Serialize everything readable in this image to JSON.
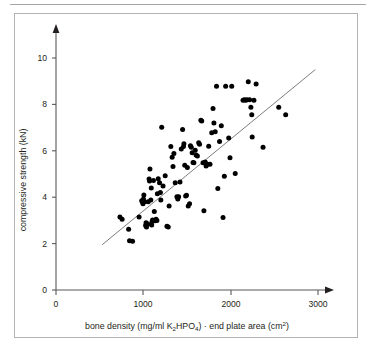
{
  "figure": {
    "background_color": "#ffffff",
    "frame_color": "#b3b3b3",
    "axis_color": "#58595b",
    "point_color": "#000000",
    "trend_color": "#6d6e71"
  },
  "chart_data": {
    "type": "scatter",
    "title": "",
    "xlabel_parts": {
      "p1": "bone density (mg/ml K",
      "sub1": "2",
      "p2": "HPO",
      "sub2": "4",
      "p3": ") · end plate area (cm",
      "sup1": "2",
      "p4": ")"
    },
    "xlabel": "bone density (mg/ml K2HPO4) · end plate area (cm2)",
    "ylabel": "compressive strength (kN)",
    "xticks": [
      0,
      1000,
      2000,
      3000
    ],
    "xtick_labels": [
      "0",
      "1000",
      "2000",
      "3000"
    ],
    "yticks": [
      0,
      2,
      4,
      6,
      8,
      10
    ],
    "ytick_labels": [
      "0",
      "2",
      "4",
      "6",
      "8",
      "10"
    ],
    "xlim": [
      0,
      3120
    ],
    "ylim": [
      0,
      11.2
    ],
    "grid": false,
    "legend": null,
    "trend_line": {
      "x": [
        530,
        2980
      ],
      "y": [
        1.95,
        9.5
      ]
    },
    "points": [
      [
        735,
        3.15
      ],
      [
        760,
        3.05
      ],
      [
        835,
        2.62
      ],
      [
        845,
        2.12
      ],
      [
        880,
        2.1
      ],
      [
        955,
        3.15
      ],
      [
        985,
        3.85
      ],
      [
        995,
        3.78
      ],
      [
        1000,
        3.72
      ],
      [
        1005,
        3.92
      ],
      [
        1010,
        4.1
      ],
      [
        1020,
        3.8
      ],
      [
        1030,
        2.78
      ],
      [
        1035,
        2.9
      ],
      [
        1040,
        2.72
      ],
      [
        1055,
        2.85
      ],
      [
        1060,
        3.8
      ],
      [
        1070,
        4.78
      ],
      [
        1075,
        4.7
      ],
      [
        1080,
        5.22
      ],
      [
        1090,
        3.88
      ],
      [
        1095,
        4.4
      ],
      [
        1100,
        2.8
      ],
      [
        1105,
        2.95
      ],
      [
        1110,
        3.02
      ],
      [
        1120,
        4.72
      ],
      [
        1130,
        3.38
      ],
      [
        1140,
        2.98
      ],
      [
        1150,
        3.05
      ],
      [
        1160,
        3.0
      ],
      [
        1165,
        4.15
      ],
      [
        1175,
        4.8
      ],
      [
        1190,
        4.62
      ],
      [
        1200,
        4.2
      ],
      [
        1205,
        3.88
      ],
      [
        1215,
        7.02
      ],
      [
        1230,
        4.48
      ],
      [
        1255,
        4.92
      ],
      [
        1275,
        2.75
      ],
      [
        1290,
        2.72
      ],
      [
        1300,
        3.62
      ],
      [
        1320,
        6.18
      ],
      [
        1335,
        5.72
      ],
      [
        1345,
        5.32
      ],
      [
        1355,
        5.88
      ],
      [
        1370,
        4.62
      ],
      [
        1390,
        4.02
      ],
      [
        1400,
        3.92
      ],
      [
        1410,
        4.02
      ],
      [
        1425,
        4.65
      ],
      [
        1440,
        6.08
      ],
      [
        1455,
        6.92
      ],
      [
        1465,
        6.18
      ],
      [
        1470,
        6.3
      ],
      [
        1480,
        5.38
      ],
      [
        1490,
        4.05
      ],
      [
        1500,
        4.08
      ],
      [
        1510,
        5.28
      ],
      [
        1520,
        3.62
      ],
      [
        1535,
        3.72
      ],
      [
        1545,
        6.22
      ],
      [
        1555,
        6.15
      ],
      [
        1565,
        5.92
      ],
      [
        1575,
        5.5
      ],
      [
        1585,
        5.48
      ],
      [
        1600,
        6.02
      ],
      [
        1610,
        5.82
      ],
      [
        1625,
        5.78
      ],
      [
        1640,
        6.35
      ],
      [
        1650,
        6.28
      ],
      [
        1665,
        7.32
      ],
      [
        1675,
        7.28
      ],
      [
        1690,
        5.48
      ],
      [
        1700,
        3.42
      ],
      [
        1715,
        5.52
      ],
      [
        1725,
        5.35
      ],
      [
        1740,
        5.42
      ],
      [
        1755,
        6.2
      ],
      [
        1770,
        5.42
      ],
      [
        1790,
        6.78
      ],
      [
        1805,
        7.82
      ],
      [
        1815,
        7.2
      ],
      [
        1830,
        6.82
      ],
      [
        1845,
        8.78
      ],
      [
        1860,
        4.38
      ],
      [
        1880,
        6.4
      ],
      [
        1900,
        7.08
      ],
      [
        1920,
        3.12
      ],
      [
        1935,
        4.9
      ],
      [
        1950,
        8.78
      ],
      [
        1985,
        6.55
      ],
      [
        2000,
        5.7
      ],
      [
        2020,
        8.78
      ],
      [
        2060,
        5.02
      ],
      [
        2150,
        8.18
      ],
      [
        2165,
        8.2
      ],
      [
        2180,
        8.18
      ],
      [
        2195,
        8.2
      ],
      [
        2210,
        8.98
      ],
      [
        2225,
        8.2
      ],
      [
        2240,
        7.88
      ],
      [
        2250,
        7.55
      ],
      [
        2255,
        6.6
      ],
      [
        2275,
        8.18
      ],
      [
        2300,
        8.88
      ],
      [
        2380,
        6.15
      ],
      [
        2560,
        7.88
      ],
      [
        2640,
        7.55
      ]
    ]
  }
}
